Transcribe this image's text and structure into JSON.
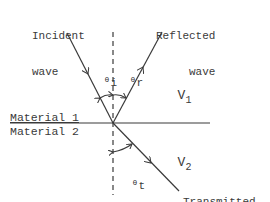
{
  "diagram": {
    "type": "wave refraction/reflection at material interface",
    "labels": {
      "incident": [
        "Incident",
        "wave"
      ],
      "reflected": [
        "Reflected",
        "wave"
      ],
      "transmitted": [
        "Transmitted",
        "wave"
      ],
      "material_1": "Material 1",
      "material_2": "Material 2",
      "v1": {
        "base": "V",
        "sub": "1"
      },
      "v2": {
        "base": "V",
        "sub": "2"
      },
      "theta_i": {
        "base": "θ",
        "sub": "i"
      },
      "theta_r": {
        "base": "θ",
        "sub": "r"
      },
      "theta_t": {
        "base": "θ",
        "sub": "t"
      }
    },
    "geometry": {
      "interface_point": [
        113,
        123
      ],
      "interface_line": [
        [
          10,
          123
        ],
        [
          210,
          123
        ]
      ],
      "normal_line": [
        [
          113,
          32
        ],
        [
          113,
          195
        ]
      ],
      "incident_ray": [
        [
          67,
          33
        ],
        [
          113,
          123
        ]
      ],
      "reflected_ray": [
        [
          113,
          123
        ],
        [
          162,
          32
        ]
      ],
      "transmitted_ray": [
        [
          113,
          123
        ],
        [
          179,
          191
        ]
      ]
    },
    "colors": {
      "line": "#3a3a3a",
      "text": "#3a3a3a",
      "background": "#ffffff"
    }
  }
}
